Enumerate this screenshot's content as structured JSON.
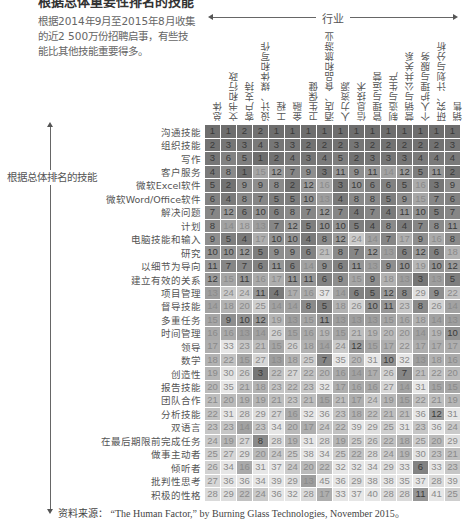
{
  "title": "根据总体重要性排名的技能",
  "intro": "根据2014年9月至2015年8月收集的近2 500万份招聘启事，有些技能比其他技能重要得多。",
  "industry_axis_label": "行业",
  "skill_axis_label": "根据总体排名的技能",
  "source": "资料来源： “The Human Factor,” by Burning Glass Technologies, November 2015。",
  "chart_data": {
    "type": "heatmap",
    "title": "根据总体重要性排名的技能",
    "xlabel": "行业",
    "ylabel": "根据总体排名的技能",
    "columns": [
      "总体",
      "文书和行政",
      "客户支持",
      "设计、媒体和写作",
      "工程",
      "金融",
      "卫生保健",
      "酒店、食品和旅游业",
      "人力资源",
      "信息技术",
      "管理与运营",
      "制造与生产",
      "营销与公共关系",
      "个人护理与服务",
      "研究、计划与分析",
      "销售"
    ],
    "rows": [
      "沟通技能",
      "组织技能",
      "写作",
      "客户服务",
      "微软Excel软件",
      "微软Word/Office软件",
      "解决问题",
      "计划",
      "电脑技能和输入",
      "研究",
      "以细节为导向",
      "建立有效的关系",
      "项目管理",
      "督导技能",
      "多重任务",
      "时间管理",
      "领导",
      "数学",
      "创造性",
      "报告技能",
      "团队合作",
      "分析技能",
      "双语言",
      "在最后期限前完成任务",
      "做事主动者",
      "倾听者",
      "批判性思考",
      "积极的性格"
    ],
    "values": [
      [
        1,
        1,
        2,
        2,
        1,
        1,
        1,
        1,
        1,
        1,
        1,
        1,
        1,
        1,
        1,
        1
      ],
      [
        2,
        3,
        3,
        4,
        3,
        3,
        2,
        2,
        2,
        3,
        2,
        2,
        2,
        2,
        2,
        3
      ],
      [
        3,
        6,
        5,
        1,
        2,
        4,
        3,
        4,
        5,
        2,
        3,
        3,
        3,
        4,
        4,
        4
      ],
      [
        4,
        8,
        1,
        15,
        12,
        7,
        9,
        3,
        11,
        9,
        11,
        14,
        12,
        5,
        11,
        2
      ],
      [
        5,
        2,
        9,
        9,
        8,
        2,
        12,
        16,
        3,
        10,
        6,
        6,
        5,
        16,
        3,
        9
      ],
      [
        6,
        4,
        8,
        7,
        5,
        5,
        10,
        13,
        4,
        8,
        8,
        5,
        9,
        15,
        7,
        6
      ],
      [
        7,
        12,
        6,
        10,
        6,
        8,
        7,
        12,
        7,
        4,
        7,
        4,
        11,
        10,
        5,
        7
      ],
      [
        8,
        14,
        18,
        13,
        7,
        12,
        5,
        10,
        10,
        5,
        4,
        8,
        4,
        7,
        8,
        11
      ],
      [
        9,
        5,
        4,
        17,
        10,
        10,
        4,
        8,
        12,
        24,
        14,
        7,
        17,
        9,
        16,
        8
      ],
      [
        10,
        10,
        12,
        5,
        9,
        9,
        6,
        21,
        8,
        7,
        12,
        13,
        6,
        12,
        6,
        18
      ],
      [
        11,
        7,
        7,
        6,
        11,
        6,
        14,
        9,
        6,
        11,
        13,
        9,
        10,
        19,
        10,
        12
      ],
      [
        12,
        15,
        11,
        16,
        17,
        11,
        11,
        6,
        9,
        15,
        9,
        18,
        13,
        3,
        13,
        5
      ],
      [
        13,
        24,
        24,
        11,
        4,
        17,
        16,
        37,
        14,
        6,
        5,
        12,
        8,
        29,
        9,
        22
      ],
      [
        14,
        18,
        20,
        25,
        14,
        14,
        8,
        5,
        18,
        26,
        10,
        11,
        23,
        8,
        26,
        14
      ],
      [
        15,
        9,
        10,
        12,
        19,
        13,
        15,
        11,
        13,
        13,
        13,
        15,
        16,
        18,
        14,
        13
      ],
      [
        16,
        16,
        13,
        14,
        26,
        15,
        16,
        19,
        15,
        21,
        19,
        20,
        20,
        14,
        19,
        10
      ],
      [
        17,
        33,
        23,
        21,
        15,
        26,
        18,
        14,
        24,
        12,
        15,
        17,
        22,
        17,
        17,
        17
      ],
      [
        18,
        22,
        15,
        27,
        13,
        18,
        25,
        7,
        35,
        20,
        31,
        10,
        32,
        13,
        18,
        16
      ],
      [
        19,
        30,
        26,
        3,
        22,
        27,
        22,
        20,
        16,
        14,
        17,
        26,
        7,
        21,
        22,
        20
      ],
      [
        20,
        35,
        21,
        18,
        23,
        22,
        23,
        32,
        17,
        16,
        16,
        27,
        14,
        31,
        15,
        15
      ],
      [
        21,
        20,
        19,
        19,
        21,
        23,
        21,
        15,
        21,
        17,
        24,
        19,
        15,
        22,
        21,
        19
      ],
      [
        22,
        31,
        28,
        29,
        27,
        16,
        32,
        36,
        23,
        18,
        22,
        21,
        21,
        36,
        12,
        31
      ],
      [
        23,
        23,
        14,
        23,
        34,
        20,
        17,
        24,
        22,
        39,
        29,
        25,
        31,
        23,
        36,
        24
      ],
      [
        24,
        19,
        27,
        8,
        28,
        19,
        31,
        28,
        19,
        25,
        26,
        22,
        18,
        25,
        20,
        29
      ],
      [
        25,
        27,
        29,
        20,
        24,
        25,
        38,
        34,
        25,
        22,
        28,
        24,
        19,
        30,
        23,
        21
      ],
      [
        26,
        34,
        16,
        31,
        37,
        24,
        20,
        22,
        32,
        32,
        34,
        29,
        33,
        6,
        33,
        23
      ],
      [
        27,
        36,
        36,
        34,
        39,
        29,
        13,
        45,
        36,
        29,
        38,
        38,
        35,
        37,
        28,
        39
      ],
      [
        28,
        29,
        22,
        24,
        36,
        32,
        28,
        17,
        33,
        37,
        40,
        28,
        28,
        11,
        41,
        25
      ]
    ],
    "color_scale": {
      "low_rank": "#6e6e6e",
      "high_rank": "#e4e4e4"
    }
  }
}
